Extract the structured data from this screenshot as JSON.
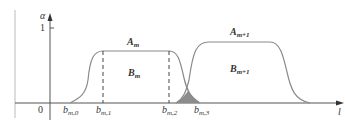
{
  "diagram": {
    "y_axis_label": "α",
    "x_axis_label": "l",
    "origin_label": "0",
    "y_tick_label": "1",
    "region_labels": {
      "A_m": {
        "main": "A",
        "sub": "m"
      },
      "B_m": {
        "main": "B",
        "sub": "m"
      },
      "A_m1": {
        "main": "A",
        "sub": "m+1"
      },
      "B_m1": {
        "main": "B",
        "sub": "m+1"
      }
    },
    "x_ticks": [
      {
        "main": "b",
        "sub": "m,0"
      },
      {
        "main": "b",
        "sub": "m,1"
      },
      {
        "main": "b",
        "sub": "m,2"
      },
      {
        "main": "b",
        "sub": "m,3"
      }
    ],
    "colors": {
      "line": "#8a8a8a",
      "axis": "#555555",
      "overlap_fill": "#8c8c8c"
    }
  }
}
